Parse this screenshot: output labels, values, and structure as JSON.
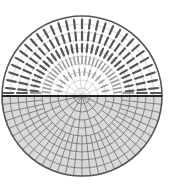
{
  "diagram": {
    "upper_half": {
      "fill": "#ffffff",
      "dash_color_outer": "#555555",
      "dash_color_inner": "#9a9a9a",
      "rings": 10,
      "rays_angle_step_deg": 6
    },
    "lower_half": {
      "fill": "#d9d9d9",
      "grid_color": "#6e6e6e",
      "rings": 10,
      "rays_angle_step_deg": 6
    },
    "outline_color": "#555555",
    "divider_color": "#222222"
  }
}
